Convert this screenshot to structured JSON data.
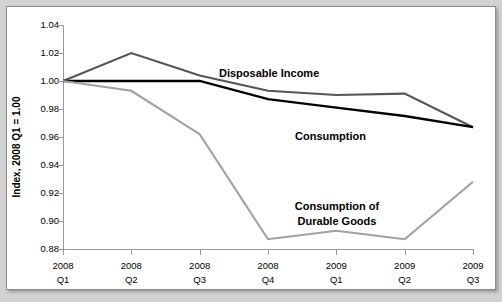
{
  "chart_data": {
    "type": "line",
    "title": "",
    "xlabel": "",
    "ylabel": "Index, 2008 Q1 = 1.00",
    "ylim": [
      0.88,
      1.04
    ],
    "ytick_step": 0.02,
    "grid": false,
    "legend_position": "inline-annotations",
    "categories": [
      "2008 Q1",
      "2008 Q2",
      "2008 Q3",
      "2008 Q4",
      "2009 Q1",
      "2009 Q2",
      "2009 Q3"
    ],
    "category_lines": [
      {
        "year": "2008",
        "quarter": "Q1"
      },
      {
        "year": "2008",
        "quarter": "Q2"
      },
      {
        "year": "2008",
        "quarter": "Q3"
      },
      {
        "year": "2008",
        "quarter": "Q4"
      },
      {
        "year": "2009",
        "quarter": "Q1"
      },
      {
        "year": "2009",
        "quarter": "Q2"
      },
      {
        "year": "2009",
        "quarter": "Q3"
      }
    ],
    "ytick_labels": [
      "1.04",
      "1.02",
      "1.00",
      "0.98",
      "0.96",
      "0.94",
      "0.92",
      "0.90",
      "0.88"
    ],
    "ytick_values": [
      1.04,
      1.02,
      1.0,
      0.98,
      0.96,
      0.94,
      0.92,
      0.9,
      0.88
    ],
    "series": [
      {
        "name": "Disposable Income",
        "color": "#555555",
        "width": 2.1,
        "values": [
          1.0,
          1.02,
          1.004,
          0.993,
          0.99,
          0.991,
          0.967
        ],
        "label": {
          "text": "Disposable Income",
          "x": 212,
          "y": 70
        }
      },
      {
        "name": "Consumption",
        "color": "#000000",
        "width": 2.3,
        "values": [
          1.0,
          1.0,
          1.0,
          0.987,
          0.981,
          0.975,
          0.967
        ],
        "label": {
          "text": "Consumption",
          "x": 288,
          "y": 133
        }
      },
      {
        "name": "Consumption of Durable Goods",
        "color": "#a0a0a0",
        "width": 2.1,
        "values": [
          1.0,
          0.993,
          0.962,
          0.887,
          0.893,
          0.887,
          0.928
        ],
        "label": {
          "text_line1": "Consumption of",
          "text_line2": "Durable Goods",
          "x": 330,
          "y": 203
        }
      }
    ]
  }
}
